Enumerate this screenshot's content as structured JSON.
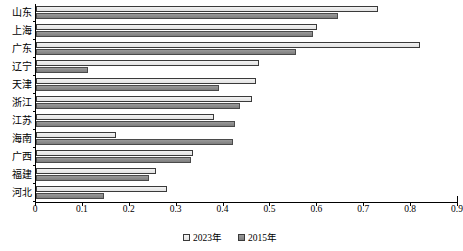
{
  "chart_data": {
    "type": "bar",
    "orientation": "horizontal",
    "title": "",
    "xlabel": "",
    "ylabel": "",
    "xlim": [
      0,
      0.9
    ],
    "grid": false,
    "legend_position": "bottom",
    "xticks": [
      "0",
      "0.1",
      "0.2",
      "0.3",
      "0.4",
      "0.5",
      "0.6",
      "0.7",
      "0.8",
      "0.9"
    ],
    "xtick_values": [
      0,
      0.1,
      0.2,
      0.3,
      0.4,
      0.5,
      0.6,
      0.7,
      0.8,
      0.9
    ],
    "categories": [
      "山东",
      "上海",
      "广东",
      "辽宁",
      "天津",
      "浙江",
      "江苏",
      "海南",
      "广西",
      "福建",
      "河北"
    ],
    "series": [
      {
        "name": "2023年",
        "color": "#ececec",
        "values": [
          0.73,
          0.6,
          0.82,
          0.475,
          0.47,
          0.46,
          0.38,
          0.17,
          0.335,
          0.255,
          0.28
        ]
      },
      {
        "name": "2015年",
        "color": "#8a8a8a",
        "values": [
          0.645,
          0.59,
          0.555,
          0.11,
          0.39,
          0.435,
          0.425,
          0.42,
          0.33,
          0.24,
          0.145
        ]
      }
    ]
  },
  "legend": {
    "items": [
      {
        "label": "2023年",
        "swatch": "legend-swatch-2023"
      },
      {
        "label": "2015年",
        "swatch": "legend-swatch-2015"
      }
    ]
  }
}
